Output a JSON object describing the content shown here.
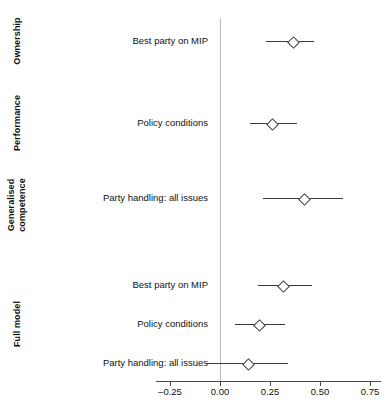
{
  "chart_data": {
    "type": "scatter",
    "title": "",
    "xlabel": "",
    "ylabel": "",
    "xlim": [
      -0.35,
      0.8
    ],
    "xticks": [
      -0.25,
      0.0,
      0.25,
      0.5,
      0.75
    ],
    "xtick_labels": [
      "–0.25",
      "0.00",
      "0.25",
      "0.50",
      "0.75"
    ],
    "grid": false,
    "legend": "none",
    "reference_line": 0.0,
    "marker_style": "open-diamond",
    "annotation": "Point estimates with horizontal confidence-interval whiskers; vertical reference line at 0.00.",
    "groups": [
      {
        "name": "Ownership",
        "lines": [
          "Ownership"
        ],
        "rows": [
          {
            "label": "Best party on MIP",
            "estimate": 0.36,
            "ci_low": 0.23,
            "ci_high": 0.47
          }
        ]
      },
      {
        "name": "Performance",
        "lines": [
          "Performance"
        ],
        "rows": [
          {
            "label": "Policy conditions",
            "estimate": 0.255,
            "ci_low": 0.15,
            "ci_high": 0.385
          }
        ]
      },
      {
        "name": "Generalised competence",
        "lines": [
          "Generalised",
          "competence"
        ],
        "rows": [
          {
            "label": "Party handling: all issues",
            "estimate": 0.415,
            "ci_low": 0.215,
            "ci_high": 0.615
          }
        ]
      },
      {
        "name": "Full model",
        "lines": [
          "Full model"
        ],
        "rows": [
          {
            "label": "Best party on MIP",
            "estimate": 0.31,
            "ci_low": 0.19,
            "ci_high": 0.46
          },
          {
            "label": "Policy conditions",
            "estimate": 0.19,
            "ci_low": 0.075,
            "ci_high": 0.325
          },
          {
            "label": "Party handling: all issues",
            "estimate": 0.135,
            "ci_low": -0.065,
            "ci_high": 0.34
          }
        ]
      }
    ],
    "colors": {
      "marker_edge": "#3a3a3a",
      "marker_fill": "#ffffff",
      "ci_line": "#3a3a3a",
      "reference_line": "#b9b9b9",
      "axis": "#4a4a4a",
      "text": "#111111",
      "background": "#ffffff"
    }
  },
  "layout": {
    "row_y": [
      41,
      123,
      198,
      285,
      324,
      363
    ],
    "group_label_positions": [
      {
        "center_y": 41,
        "height": 74
      },
      {
        "center_y": 123,
        "height": 74
      },
      {
        "center_y": 205,
        "height": 74
      },
      {
        "center_y": 324,
        "height": 90
      }
    ],
    "axis_y": 381,
    "axis_x_left": 156,
    "axis_x_right": 381,
    "px_per_unit": 200,
    "x_zero_px": 220,
    "zero_line_top": 18,
    "zero_line_bottom": 381,
    "tick_label_y": 386
  }
}
